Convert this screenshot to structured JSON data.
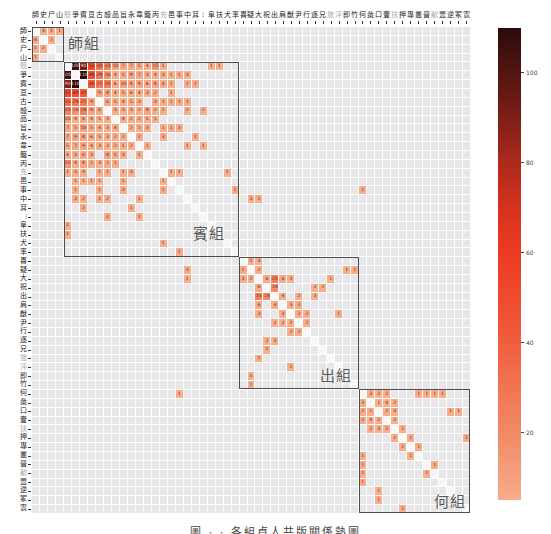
{
  "chart_data": {
    "type": "heatmap",
    "title": "",
    "xlabel": "",
    "ylabel": "",
    "caption": "圖 · · 各組貞人共版關係熱圖",
    "labels": [
      "師",
      "史",
      "尸",
      "山",
      "殼",
      "爭",
      "賓",
      "亘",
      "古",
      "㱿",
      "品",
      "旨",
      "永",
      "韋",
      "箙",
      "丙",
      "充",
      "邑",
      "事",
      "中",
      "耳",
      "⁝",
      "阜",
      "扶",
      "犬",
      "率",
      "喜",
      "疑",
      "大",
      "祝",
      "出",
      "肩",
      "猷",
      "尹",
      "行",
      "逐",
      "兄",
      "旅",
      "泙",
      "即",
      "竹",
      "何",
      "彘",
      "口",
      "壹",
      "扶",
      "押",
      "專",
      "叢",
      "晉",
      "㱃",
      "豐",
      "逆",
      "冢",
      "㝨"
    ],
    "muted_labels": [
      4,
      16,
      37,
      38,
      45,
      50
    ],
    "groups": [
      {
        "name": "師組",
        "start": 0,
        "end": 3
      },
      {
        "name": "賓組",
        "start": 4,
        "end": 25
      },
      {
        "name": "出組",
        "start": 26,
        "end": 40
      },
      {
        "name": "何組",
        "start": 41,
        "end": 54
      }
    ],
    "symmetric": true,
    "diagonal": "masked",
    "grid": true,
    "empty_cell_color": "#e7e7e9",
    "pairs": [
      [
        0,
        1,
        4
      ],
      [
        0,
        2,
        1
      ],
      [
        0,
        3,
        1
      ],
      [
        1,
        2,
        2
      ],
      [
        4,
        5,
        105
      ],
      [
        4,
        6,
        90
      ],
      [
        4,
        7,
        51
      ],
      [
        4,
        8,
        30
      ],
      [
        4,
        9,
        23
      ],
      [
        4,
        10,
        10
      ],
      [
        4,
        11,
        7
      ],
      [
        4,
        12,
        7
      ],
      [
        4,
        13,
        5
      ],
      [
        4,
        14,
        4
      ],
      [
        4,
        15,
        15
      ],
      [
        4,
        16,
        1
      ],
      [
        4,
        22,
        1
      ],
      [
        4,
        23,
        1
      ],
      [
        5,
        6,
        110
      ],
      [
        5,
        7,
        48
      ],
      [
        5,
        8,
        29
      ],
      [
        5,
        9,
        16
      ],
      [
        5,
        10,
        4
      ],
      [
        5,
        11,
        5
      ],
      [
        5,
        12,
        9
      ],
      [
        5,
        13,
        7
      ],
      [
        5,
        14,
        3
      ],
      [
        5,
        15,
        4
      ],
      [
        5,
        16,
        3
      ],
      [
        5,
        17,
        1
      ],
      [
        5,
        18,
        1
      ],
      [
        5,
        19,
        3
      ],
      [
        6,
        7,
        40
      ],
      [
        6,
        8,
        27
      ],
      [
        6,
        9,
        24
      ],
      [
        6,
        10,
        6
      ],
      [
        6,
        11,
        10
      ],
      [
        6,
        12,
        8
      ],
      [
        6,
        13,
        9
      ],
      [
        6,
        14,
        6
      ],
      [
        6,
        15,
        8
      ],
      [
        6,
        16,
        4
      ],
      [
        6,
        17,
        1
      ],
      [
        6,
        19,
        2
      ],
      [
        6,
        20,
        2
      ],
      [
        7,
        8,
        9
      ],
      [
        7,
        9,
        8
      ],
      [
        7,
        10,
        4
      ],
      [
        7,
        11,
        5
      ],
      [
        7,
        12,
        6
      ],
      [
        7,
        13,
        4
      ],
      [
        7,
        14,
        3
      ],
      [
        7,
        15,
        2
      ],
      [
        7,
        17,
        1
      ],
      [
        8,
        9,
        6
      ],
      [
        8,
        10,
        5
      ],
      [
        8,
        11,
        4
      ],
      [
        8,
        12,
        5
      ],
      [
        8,
        13,
        3
      ],
      [
        8,
        15,
        3
      ],
      [
        8,
        16,
        1
      ],
      [
        8,
        17,
        1
      ],
      [
        8,
        18,
        1
      ],
      [
        8,
        19,
        1
      ],
      [
        9,
        10,
        3
      ],
      [
        9,
        11,
        3
      ],
      [
        9,
        12,
        3
      ],
      [
        9,
        13,
        2
      ],
      [
        9,
        14,
        8
      ],
      [
        9,
        15,
        2
      ],
      [
        9,
        16,
        1
      ],
      [
        9,
        19,
        2
      ],
      [
        9,
        21,
        2
      ],
      [
        10,
        11,
        4
      ],
      [
        10,
        12,
        2
      ],
      [
        10,
        13,
        2
      ],
      [
        10,
        14,
        5
      ],
      [
        10,
        15,
        1
      ],
      [
        11,
        12,
        2
      ],
      [
        11,
        13,
        1
      ],
      [
        11,
        14,
        3
      ],
      [
        11,
        16,
        1
      ],
      [
        11,
        17,
        1
      ],
      [
        11,
        18,
        3
      ],
      [
        12,
        13,
        2
      ],
      [
        12,
        16,
        3
      ],
      [
        12,
        20,
        1
      ],
      [
        13,
        14,
        1
      ],
      [
        13,
        19,
        1
      ],
      [
        13,
        21,
        1
      ],
      [
        16,
        17,
        1
      ],
      [
        16,
        18,
        1
      ],
      [
        16,
        24,
        1
      ],
      [
        18,
        25,
        1
      ],
      [
        18,
        41,
        1
      ],
      [
        19,
        27,
        3
      ],
      [
        19,
        28,
        1
      ],
      [
        26,
        27,
        1
      ],
      [
        26,
        28,
        3
      ],
      [
        27,
        28,
        2
      ],
      [
        27,
        39,
        1
      ],
      [
        27,
        40,
        1
      ],
      [
        28,
        29,
        6
      ],
      [
        28,
        30,
        25
      ],
      [
        28,
        31,
        6
      ],
      [
        28,
        32,
        3
      ],
      [
        28,
        37,
        1
      ],
      [
        29,
        30,
        18
      ],
      [
        29,
        35,
        2
      ],
      [
        29,
        36,
        1
      ],
      [
        30,
        31,
        4
      ],
      [
        30,
        33,
        2
      ],
      [
        30,
        35,
        3
      ],
      [
        31,
        32,
        3
      ],
      [
        31,
        33,
        2
      ],
      [
        32,
        33,
        2
      ],
      [
        32,
        34,
        2
      ],
      [
        32,
        38,
        1
      ],
      [
        33,
        34,
        2
      ],
      [
        41,
        42,
        3
      ],
      [
        41,
        43,
        2
      ],
      [
        41,
        44,
        2
      ],
      [
        41,
        48,
        1
      ],
      [
        41,
        49,
        1
      ],
      [
        41,
        50,
        1
      ],
      [
        41,
        51,
        1
      ],
      [
        42,
        43,
        1
      ],
      [
        42,
        44,
        4
      ],
      [
        42,
        45,
        2
      ],
      [
        43,
        44,
        2
      ],
      [
        43,
        45,
        3
      ],
      [
        43,
        52,
        1
      ],
      [
        43,
        53,
        1
      ],
      [
        44,
        45,
        2
      ],
      [
        45,
        46,
        1
      ],
      [
        46,
        47,
        1
      ],
      [
        46,
        54,
        1
      ],
      [
        47,
        48,
        1
      ],
      [
        49,
        50,
        1
      ]
    ],
    "colorbar": {
      "min": 5,
      "max": 110,
      "ticks": [
        100,
        80,
        60,
        40,
        20
      ],
      "position": "right",
      "text_light": "#f6d6c8",
      "stops": [
        [
          5,
          "#f6ad8c"
        ],
        [
          10,
          "#f5a07e"
        ],
        [
          20,
          "#f28a66"
        ],
        [
          30,
          "#f17452"
        ],
        [
          40,
          "#f05e3d"
        ],
        [
          50,
          "#ef4a2e"
        ],
        [
          60,
          "#ec3b22"
        ],
        [
          70,
          "#d5321f"
        ],
        [
          80,
          "#ad2a1c"
        ],
        [
          90,
          "#7f1e17"
        ],
        [
          100,
          "#521512"
        ],
        [
          110,
          "#2b0b0d"
        ]
      ]
    }
  }
}
